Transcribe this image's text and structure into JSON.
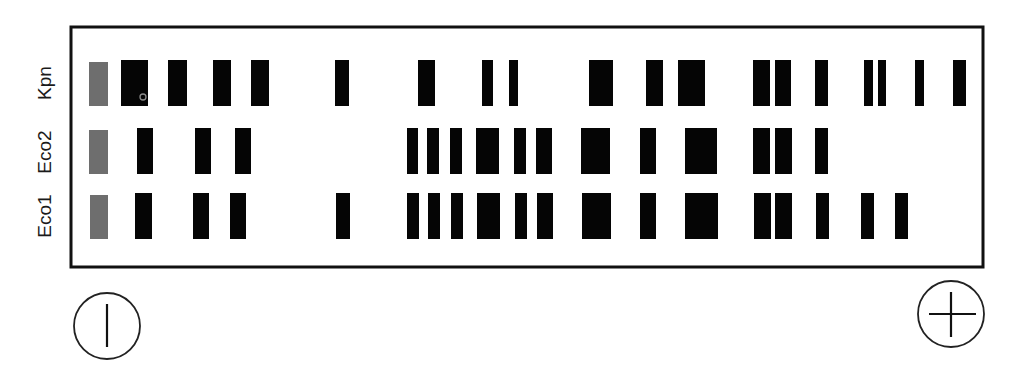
{
  "figure": {
    "type": "agarose gel electrophoresis diagram",
    "frame": {
      "x": 71,
      "y": 27,
      "width": 912,
      "height": 240,
      "stroke": "#111111",
      "stroke_width": 3
    },
    "colors": {
      "band": "#050505",
      "well": "#6e6e6e",
      "background": "#ffffff",
      "marker_ring": "#8a8a8a"
    }
  },
  "lanes": [
    {
      "label": "Kpn",
      "label_center": {
        "x": 45,
        "y": 83
      },
      "y_top": 60,
      "y_bottom": 106,
      "well": {
        "x1": 89,
        "x2": 108
      },
      "bands": [
        {
          "x1": 121,
          "x2": 148
        },
        {
          "x1": 168,
          "x2": 187
        },
        {
          "x1": 213,
          "x2": 231
        },
        {
          "x1": 251,
          "x2": 269
        },
        {
          "x1": 335,
          "x2": 349
        },
        {
          "x1": 418,
          "x2": 435
        },
        {
          "x1": 482,
          "x2": 493
        },
        {
          "x1": 509,
          "x2": 518
        },
        {
          "x1": 589,
          "x2": 613
        },
        {
          "x1": 646,
          "x2": 663
        },
        {
          "x1": 678,
          "x2": 705
        },
        {
          "x1": 753,
          "x2": 770
        },
        {
          "x1": 775,
          "x2": 791
        },
        {
          "x1": 815,
          "x2": 828
        },
        {
          "x1": 864,
          "x2": 873
        },
        {
          "x1": 878,
          "x2": 886
        },
        {
          "x1": 915,
          "x2": 924
        },
        {
          "x1": 953,
          "x2": 966
        }
      ]
    },
    {
      "label": "Eco2",
      "label_center": {
        "x": 45,
        "y": 152
      },
      "y_top": 128,
      "y_bottom": 174,
      "well": {
        "x1": 89,
        "x2": 108
      },
      "bands": [
        {
          "x1": 137,
          "x2": 153
        },
        {
          "x1": 195,
          "x2": 211
        },
        {
          "x1": 235,
          "x2": 251
        },
        {
          "x1": 407,
          "x2": 418
        },
        {
          "x1": 427,
          "x2": 439
        },
        {
          "x1": 450,
          "x2": 462
        },
        {
          "x1": 476,
          "x2": 499
        },
        {
          "x1": 514,
          "x2": 526
        },
        {
          "x1": 536,
          "x2": 552
        },
        {
          "x1": 581,
          "x2": 610
        },
        {
          "x1": 640,
          "x2": 656
        },
        {
          "x1": 685,
          "x2": 717
        },
        {
          "x1": 753,
          "x2": 770
        },
        {
          "x1": 775,
          "x2": 792
        },
        {
          "x1": 815,
          "x2": 828
        }
      ]
    },
    {
      "label": "Eco1",
      "label_center": {
        "x": 45,
        "y": 216
      },
      "y_top": 193,
      "y_bottom": 239,
      "well": {
        "x1": 90,
        "x2": 108
      },
      "bands": [
        {
          "x1": 135,
          "x2": 152
        },
        {
          "x1": 193,
          "x2": 209
        },
        {
          "x1": 230,
          "x2": 246
        },
        {
          "x1": 336,
          "x2": 350
        },
        {
          "x1": 407,
          "x2": 419
        },
        {
          "x1": 428,
          "x2": 440
        },
        {
          "x1": 451,
          "x2": 463
        },
        {
          "x1": 477,
          "x2": 500
        },
        {
          "x1": 515,
          "x2": 527
        },
        {
          "x1": 537,
          "x2": 553
        },
        {
          "x1": 582,
          "x2": 611
        },
        {
          "x1": 640,
          "x2": 656
        },
        {
          "x1": 685,
          "x2": 718
        },
        {
          "x1": 754,
          "x2": 771
        },
        {
          "x1": 775,
          "x2": 792
        },
        {
          "x1": 816,
          "x2": 829
        },
        {
          "x1": 861,
          "x2": 874
        },
        {
          "x1": 895,
          "x2": 908
        }
      ]
    }
  ],
  "marker": {
    "shape": "small ring",
    "cx": 143,
    "cy": 97,
    "r": 3
  },
  "electrodes": {
    "negative": {
      "symbol": "|",
      "meaning": "cathode",
      "cx": 107,
      "cy": 326,
      "r": 33
    },
    "positive": {
      "symbol": "+",
      "meaning": "anode",
      "cx": 951,
      "cy": 314,
      "r": 33
    }
  }
}
